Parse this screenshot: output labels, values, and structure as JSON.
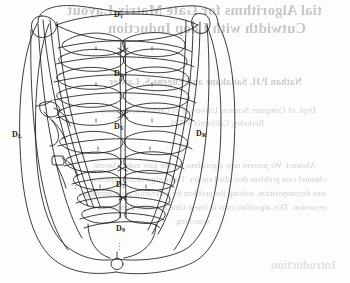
{
  "page": {
    "width": 350,
    "height": 283,
    "background_color": "#fdfdfc",
    "ink_color": "#1b1b1b",
    "bleed_text_color": "#6e6a66"
  },
  "figure": {
    "name": "nested-lens-graph-diagram",
    "caption": "",
    "node_labels": [
      {
        "id": "D1",
        "base": "D",
        "sub": "1",
        "text": "D₁",
        "x": 114,
        "y": 12
      },
      {
        "id": "D3",
        "base": "D",
        "sub": "3",
        "text": "D₃",
        "x": 114,
        "y": 71
      },
      {
        "id": "D5",
        "base": "D",
        "sub": "5",
        "text": "D₅",
        "x": 114,
        "y": 124
      },
      {
        "id": "D7",
        "base": "D",
        "sub": "7",
        "text": "D₇",
        "x": 116,
        "y": 182
      },
      {
        "id": "D9",
        "base": "D",
        "sub": "9",
        "text": "D₉",
        "x": 116,
        "y": 226
      },
      {
        "id": "DL",
        "base": "D",
        "sub": "L",
        "text": "D_L",
        "x": 12,
        "y": 132
      },
      {
        "id": "DR",
        "base": "D",
        "sub": "R",
        "text": "D_R",
        "x": 196,
        "y": 131
      }
    ],
    "ellipsis_marks": [
      {
        "id": "left-vertical-ellipsis",
        "x": 74,
        "y": 183,
        "glyph": "⋮"
      },
      {
        "id": "bottom-vertical-ellipsis",
        "x": 118,
        "y": 244,
        "glyph": "⋮"
      }
    ]
  },
  "bleed_through": {
    "note": "Faint mirror-image text showing through the page from the reverse side.",
    "title_line_1": "tial Algorithms for Gate Matrix Layout",
    "title_line_2": "Cutwidth with Loop Induction",
    "authors": "Nathan P.H. Sadakane and Eugene S. Lawler",
    "affiliation_1": "Dept. of Computer Science, University of California, Berkeley",
    "affiliation_2": "Berkeley, California 94720",
    "abstract_line_1": "Abstract  We present new algorithms for the gate matrix layout",
    "abstract_line_2": "channel cost problem described earlier. These algorithms exploit a",
    "abstract_line_3": "tree decomposition, solving the problem by a dynamic programming",
    "abstract_line_4": "recursion. This algorithm runs in linear time for fixed dimension",
    "abstract_line_5": "searching.",
    "section_heading": "Introduction"
  }
}
